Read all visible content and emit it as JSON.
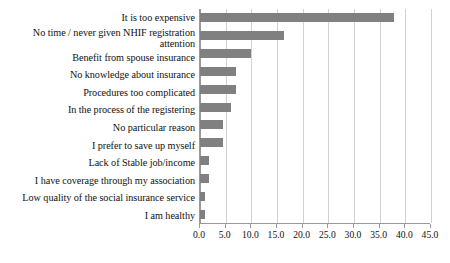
{
  "chart_data": {
    "type": "bar",
    "orientation": "horizontal",
    "title": "",
    "subtitle": "",
    "xlabel": "",
    "ylabel": "",
    "xlim": [
      0.0,
      45.0
    ],
    "xticks": [
      "0.0",
      "5.0",
      "10.0",
      "15.0",
      "20.0",
      "25.0",
      "30.0",
      "35.0",
      "40.0",
      "45.0"
    ],
    "xtick_values": [
      0,
      5,
      10,
      15,
      20,
      25,
      30,
      35,
      40,
      45
    ],
    "grid": "vertical",
    "legend": "none",
    "bar_color": "#808080",
    "grid_color": "#d2d2d2",
    "axis_color": "#9a9a9a",
    "categories": [
      "It is too expensive",
      "No time / never given NHIF registration attention",
      "Benefit from spouse insurance",
      "No knowledge about insurance",
      "Procedures too complicated",
      "In the process of the registering",
      "No particular reason",
      "I prefer to save up myself",
      "Lack of Stable job/income",
      "I have coverage through my association",
      "Low quality of the social insurance service",
      "I am healthy"
    ],
    "values": [
      37.7,
      16.3,
      10.0,
      7.0,
      7.0,
      6.0,
      4.5,
      4.5,
      1.8,
      1.8,
      1.0,
      1.0
    ]
  }
}
